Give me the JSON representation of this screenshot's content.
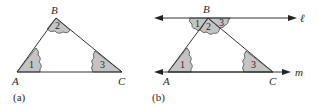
{
  "figure_a": {
    "caption": "(a)",
    "vertices": {
      "A": "A",
      "B": "B",
      "C": "C"
    },
    "angles": {
      "one": "1",
      "two": "2",
      "three": "3"
    }
  },
  "figure_b": {
    "caption": "(b)",
    "vertices": {
      "A": "A",
      "B": "B",
      "C": "C"
    },
    "angles": {
      "one_at_A": "1",
      "one_at_B": "1",
      "two_at_B": "2",
      "three_at_B": "3",
      "three_at_C": "3"
    },
    "lines": {
      "top": "ℓ",
      "bottom": "m"
    }
  },
  "colors": {
    "shade": "#c4c4c4",
    "stroke": "#333333"
  }
}
